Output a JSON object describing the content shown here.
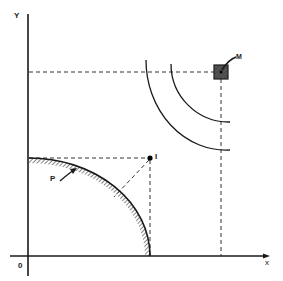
{
  "diagram": {
    "axes": {
      "y_label": "Y",
      "x_label": "x",
      "origin_label": "0"
    },
    "points": {
      "source": {
        "label": "M",
        "description": "hatched square emitter"
      },
      "image_point": {
        "label": "I"
      },
      "surface": {
        "label": "P",
        "description": "hatched quarter-circle surface"
      }
    },
    "wavefronts": {
      "count": 2
    },
    "colors": {
      "line": "#1a1a1a",
      "background": "#ffffff"
    }
  }
}
